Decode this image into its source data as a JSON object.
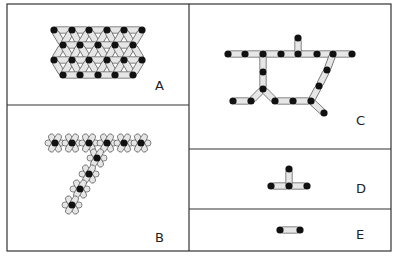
{
  "figure": {
    "panels": [
      {
        "id": "A",
        "label": "A",
        "description": "close-packed hexagonal sheet of nodes linked by rod-like connectors"
      },
      {
        "id": "B",
        "label": "B",
        "description": "branched star-shaped network forming a row with a diagonal arm"
      },
      {
        "id": "C",
        "label": "C",
        "description": "open linear branched chain network"
      },
      {
        "id": "D",
        "label": "D",
        "description": "T-shaped three-link unit"
      },
      {
        "id": "E",
        "label": "E",
        "description": "single link with two end nodes"
      }
    ],
    "colors": {
      "border": "#333333",
      "node": "#111111",
      "link_fill": "#e6e6e6",
      "link_stroke": "#555555",
      "background": "#ffffff"
    }
  },
  "geometry": {
    "A_rows": [
      {
        "y": 30,
        "xs": [
          54,
          72,
          89,
          107,
          124,
          142
        ]
      },
      {
        "y": 45,
        "xs": [
          63,
          80,
          98,
          115,
          133
        ]
      },
      {
        "y": 60,
        "xs": [
          54,
          72,
          89,
          107,
          124,
          142
        ]
      },
      {
        "y": 75,
        "xs": [
          63,
          80,
          98,
          115,
          133
        ]
      }
    ],
    "B_nodes": [
      [
        55,
        143
      ],
      [
        72,
        143
      ],
      [
        89,
        143
      ],
      [
        107,
        143
      ],
      [
        124,
        143
      ],
      [
        141,
        143
      ],
      [
        97,
        158
      ],
      [
        89,
        174
      ],
      [
        80,
        189
      ],
      [
        72,
        205
      ]
    ],
    "C_nodes": [
      [
        228,
        54
      ],
      [
        245,
        54
      ],
      [
        263,
        54
      ],
      [
        281,
        54
      ],
      [
        298,
        54
      ],
      [
        317,
        54
      ],
      [
        333,
        54
      ],
      [
        352,
        54
      ],
      [
        298,
        38
      ],
      [
        263,
        72
      ],
      [
        263,
        89
      ],
      [
        233,
        101
      ],
      [
        251,
        101
      ],
      [
        275,
        101
      ],
      [
        293,
        101
      ],
      [
        311,
        101
      ],
      [
        327,
        70
      ],
      [
        319,
        86
      ],
      [
        324,
        113
      ]
    ],
    "C_links": [
      [
        0,
        1
      ],
      [
        1,
        2
      ],
      [
        2,
        3
      ],
      [
        3,
        4
      ],
      [
        4,
        5
      ],
      [
        5,
        6
      ],
      [
        6,
        7
      ],
      [
        4,
        8
      ],
      [
        2,
        9
      ],
      [
        9,
        10
      ],
      [
        10,
        12
      ],
      [
        11,
        12
      ],
      [
        10,
        13
      ],
      [
        13,
        14
      ],
      [
        14,
        15
      ],
      [
        6,
        16
      ],
      [
        16,
        17
      ],
      [
        17,
        15
      ],
      [
        15,
        18
      ]
    ],
    "D_nodes": [
      [
        271,
        186
      ],
      [
        289,
        186
      ],
      [
        307,
        186
      ],
      [
        289,
        169
      ]
    ],
    "E_nodes": [
      [
        280,
        230
      ],
      [
        300,
        230
      ]
    ]
  }
}
